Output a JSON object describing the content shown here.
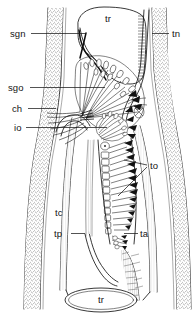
{
  "figure": {
    "type": "anatomical-line-drawing",
    "background_color": "#ffffff",
    "ink_color": "#121212",
    "width": 195,
    "height": 317
  },
  "labels": [
    {
      "key": "tr_top",
      "text": "tr",
      "x": 108,
      "y": 22,
      "anchor": "middle",
      "leader": false
    },
    {
      "key": "sgn",
      "text": "sgn",
      "x": 10,
      "y": 37,
      "anchor": "start",
      "leader": true,
      "leader_path": "M31,33.5 L86,33.5"
    },
    {
      "key": "tn",
      "text": "tn",
      "x": 172,
      "y": 37,
      "anchor": "start",
      "leader": true,
      "leader_path": "M152,33.5 L169,33.5"
    },
    {
      "key": "sgo",
      "text": "sgo",
      "x": 8,
      "y": 91,
      "anchor": "start",
      "leader": true,
      "leader_path": "M30,87.5 L105,87.5"
    },
    {
      "key": "ch",
      "text": "ch",
      "x": 12,
      "y": 112,
      "anchor": "start",
      "leader": true,
      "leader_path": "M28,108.5 L56,108.5"
    },
    {
      "key": "io",
      "text": "io",
      "x": 14,
      "y": 131,
      "anchor": "start",
      "leader": true,
      "leader_path": "M26,127.5 L107,127.5"
    },
    {
      "key": "to",
      "text": "to",
      "x": 150,
      "y": 169,
      "anchor": "start",
      "leader": true,
      "leader_path": "M124,160 L147,165 M118,196 L147,167"
    },
    {
      "key": "tc",
      "text": "tc",
      "x": 55,
      "y": 216,
      "anchor": "start",
      "leader": false
    },
    {
      "key": "tp",
      "text": "tp",
      "x": 54,
      "y": 237,
      "anchor": "start",
      "leader": true,
      "leader_path": "M71,233.5 L85,233.5"
    },
    {
      "key": "ta",
      "text": "ta",
      "x": 140,
      "y": 237,
      "anchor": "start",
      "leader": true,
      "leader_path": "M124,233.5 L138,233.5"
    },
    {
      "key": "tr_bot",
      "text": "tr",
      "x": 101,
      "y": 303,
      "anchor": "middle",
      "leader": false
    }
  ],
  "legend_keys": {
    "tr": "trachea",
    "sgn": "salivary gland neck",
    "sgo": "salivary gland opening",
    "ch": "chitinous process",
    "io": "internal opening",
    "tn": "tracheal nerve",
    "to": "tracheal ostia",
    "tc": "tracheal canal",
    "tp": "tracheal process",
    "ta": "tracheal apodeme"
  }
}
